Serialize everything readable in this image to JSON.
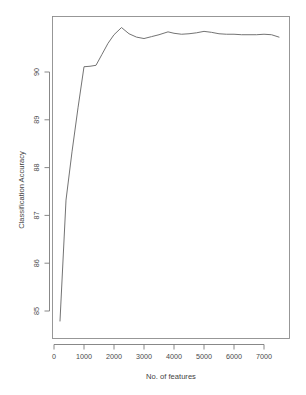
{
  "chart_data": {
    "type": "line",
    "title": "",
    "xlabel": "No. of features",
    "ylabel": "Classification Accuracy",
    "xlim": [
      0,
      7900
    ],
    "ylim": [
      84.55,
      91.05
    ],
    "xticks": [
      0,
      1000,
      2000,
      3000,
      4000,
      5000,
      6000,
      7000
    ],
    "xtick_labels": [
      "0",
      "1000",
      "2000",
      "3000",
      "4000",
      "5000",
      "6000",
      "7000"
    ],
    "yticks": [
      85,
      86,
      87,
      88,
      89,
      90
    ],
    "ytick_labels": [
      "85",
      "86",
      "87",
      "88",
      "89",
      "90"
    ],
    "grid": false,
    "legend": false,
    "line_color": "#6b6b6b",
    "frame_color": "#8d8d8d",
    "background": "#ffffff",
    "series": [
      {
        "name": "Classification Accuracy",
        "x": [
          200,
          400,
          600,
          800,
          1000,
          1200,
          1400,
          1600,
          1800,
          2000,
          2250,
          2500,
          2750,
          3000,
          3250,
          3500,
          3800,
          4000,
          4250,
          4500,
          4750,
          5000,
          5250,
          5500,
          5750,
          6000,
          6250,
          6500,
          6750,
          7000,
          7250,
          7500
        ],
        "y": [
          84.79,
          87.32,
          88.33,
          89.25,
          90.11,
          90.12,
          90.14,
          90.37,
          90.6,
          90.78,
          90.93,
          90.8,
          90.73,
          90.7,
          90.74,
          90.78,
          90.84,
          90.81,
          90.79,
          90.8,
          90.82,
          90.85,
          90.83,
          90.8,
          90.79,
          90.79,
          90.78,
          90.78,
          90.78,
          90.79,
          90.78,
          90.73
        ]
      }
    ]
  },
  "axes": {
    "x_title": "No. of features",
    "y_title": "Classification Accuracy"
  }
}
